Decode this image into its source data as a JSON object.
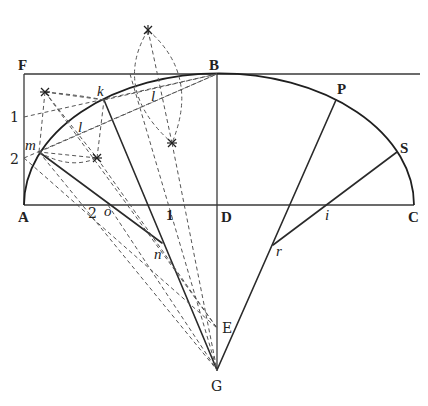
{
  "figure": {
    "labels": {
      "F": "F",
      "B": "B",
      "P": "P",
      "S": "S",
      "A": "A",
      "C": "C",
      "D": "D",
      "E": "E",
      "G": "G",
      "k": "k",
      "l_left": "l",
      "l_upper": "l",
      "m": "m",
      "n": "n",
      "o": "o",
      "r": "r",
      "i": "i",
      "one_side": "1",
      "two_side": "2",
      "two_base": "2",
      "one_base": "1"
    },
    "points": {
      "F": [
        24,
        74
      ],
      "B": [
        217,
        74
      ],
      "A": [
        24,
        205
      ],
      "C": [
        414,
        205
      ],
      "D": [
        217,
        205
      ],
      "E": [
        217,
        328
      ],
      "G": [
        217,
        370
      ],
      "k": [
        104,
        100
      ],
      "m": [
        39,
        152
      ],
      "n": [
        162,
        243
      ],
      "o": [
        108,
        205
      ],
      "P": [
        336,
        100
      ],
      "S": [
        397,
        152
      ],
      "r": [
        273,
        245
      ],
      "i": [
        332,
        205
      ],
      "side1": [
        24,
        117
      ],
      "side2": [
        24,
        158
      ],
      "star_top": [
        148,
        30
      ],
      "star_upper_left": [
        45,
        92
      ],
      "star_lower_left": [
        97,
        158
      ],
      "star_lower_right": [
        172,
        143
      ]
    }
  }
}
